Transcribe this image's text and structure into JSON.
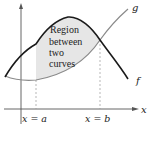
{
  "diagram": {
    "region_label": [
      "Region",
      "between",
      "two",
      "curves"
    ],
    "curve_f_label": "f",
    "curve_g_label": "g",
    "x_axis_label": "x",
    "bound_a_label": "x = a",
    "bound_b_label": "x = b",
    "colors": {
      "curve_f": "#1a1a1a",
      "curve_g": "#8a8a8a",
      "region_fill": "#e6e6e6",
      "axis": "#555555",
      "dashed": "#999999"
    }
  }
}
